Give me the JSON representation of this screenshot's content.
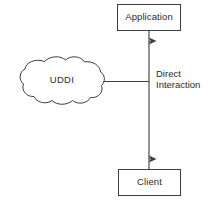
{
  "diagram": {
    "type": "block-diagram",
    "canvas": {
      "width": 210,
      "height": 202,
      "background": "#ffffff"
    },
    "stroke_color": "#3c3c3c",
    "text_color": "#2b2b2b",
    "nodes": [
      {
        "id": "application",
        "label": "Application",
        "shape": "rectangle",
        "x": 117,
        "y": 4,
        "width": 64,
        "height": 27
      },
      {
        "id": "client",
        "label": "Client",
        "shape": "rectangle",
        "x": 118,
        "y": 169,
        "width": 63,
        "height": 27
      },
      {
        "id": "uddi",
        "label": "UDDI",
        "shape": "cloud",
        "x": 20,
        "y": 57,
        "width": 84,
        "height": 48
      }
    ],
    "edges": [
      {
        "id": "application-client",
        "from": "application",
        "to": "client",
        "arrow": "double",
        "orientation": "vertical",
        "label_lines": [
          "Direct",
          "Interaction"
        ]
      },
      {
        "id": "uddi-connector",
        "from": "uddi",
        "to": "application-client",
        "arrow": "none",
        "orientation": "horizontal",
        "label_lines": []
      }
    ]
  },
  "labels": {
    "application": "Application",
    "client": "Client",
    "uddi": "UDDI",
    "direct": "Direct",
    "interaction": "Interaction"
  }
}
